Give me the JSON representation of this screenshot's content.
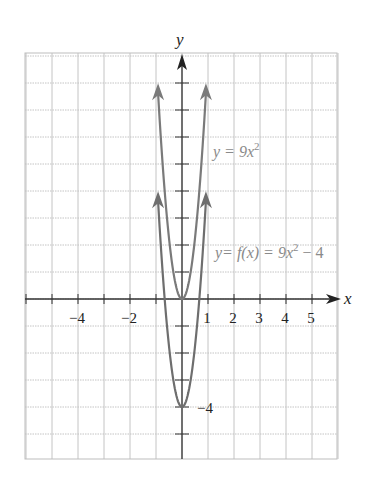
{
  "chart_data": {
    "type": "line",
    "title": "",
    "xlabel": "x",
    "ylabel": "y",
    "xlim": [
      -6,
      6
    ],
    "ylim": [
      -6,
      9
    ],
    "grid": true,
    "x_tick_labels": [
      "-4",
      "-2",
      "1",
      "2",
      "3",
      "4",
      "5"
    ],
    "x_tick_values": [
      -4,
      -2,
      1,
      2,
      3,
      4,
      5
    ],
    "y_tick_labels": [
      "-4"
    ],
    "y_tick_values": [
      -4
    ],
    "series": [
      {
        "name": "y = 9x^2",
        "formula": "9x^2",
        "vertex": [
          0,
          0
        ],
        "x_range": [
          -0.92,
          0.92
        ],
        "color": "#7a7a7a",
        "arrows": true
      },
      {
        "name": "y = f(x) = 9x^2 - 4",
        "formula": "9x^2 - 4",
        "vertex": [
          0,
          -4
        ],
        "x_range": [
          -0.92,
          0.92
        ],
        "color": "#6e6e6e",
        "arrows": true
      }
    ],
    "annotations": [
      {
        "text": "y = 9x²",
        "near": [
          1.2,
          5.7
        ]
      },
      {
        "text": "y = f(x) = 9x² − 4",
        "near": [
          1.2,
          1.7
        ]
      },
      {
        "text": "−4",
        "near": [
          0.8,
          -4
        ]
      }
    ]
  },
  "labels": {
    "x_axis": "x",
    "y_axis": "y",
    "curve1": {
      "lhs": "y = 9x",
      "exp": "2"
    },
    "curve2": {
      "lhs": "y= f(x) = 9x",
      "exp": "2",
      "tail": " − 4"
    },
    "ticks_x": [
      {
        "text": "−4",
        "x": 77
      },
      {
        "text": "−2",
        "x": 129
      },
      {
        "text": "1",
        "x": 207
      },
      {
        "text": "2",
        "x": 233
      },
      {
        "text": "3",
        "x": 259
      },
      {
        "text": "4",
        "x": 285
      },
      {
        "text": "5",
        "x": 311
      }
    ],
    "tick_y_minus4": "−4"
  }
}
